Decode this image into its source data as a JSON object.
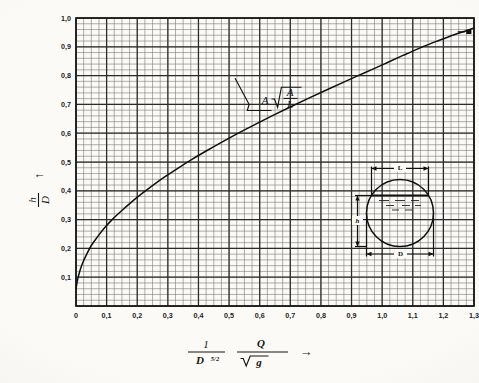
{
  "figure": {
    "background_color": "#fbfaf7",
    "ink_color": "#1a1a1a",
    "grid_minor_color": "#6f6f6f",
    "grid_major_color": "#2b2b2b"
  },
  "axes": {
    "y_title_numerator": "h",
    "y_title_denominator": "D",
    "y_title_arrow": "↑",
    "x_title_part1_numerator": "1",
    "x_title_part1_denominator": "D",
    "x_title_part1_exponent": "5/2",
    "x_title_part2_numerator": "Q",
    "x_title_part2_denominator_radicand": "g",
    "x_title_arrow": "→",
    "y_tick_labels": [
      "0,1",
      "0,2",
      "0,3",
      "0,4",
      "0,5",
      "0,6",
      "0,7",
      "0,8",
      "0,9",
      "1,0"
    ],
    "y_tick_values": [
      0.1,
      0.2,
      0.3,
      0.4,
      0.5,
      0.6,
      0.7,
      0.8,
      0.9,
      1.0
    ],
    "x_tick_labels": [
      "0",
      "0,1",
      "0,2",
      "0,3",
      "0,4",
      "0,5",
      "0,6",
      "0,7",
      "0,8",
      "0,9",
      "1,0",
      "1,1",
      "1,2",
      "1,3"
    ],
    "x_tick_values": [
      0,
      0.1,
      0.2,
      0.3,
      0.4,
      0.5,
      0.6,
      0.7,
      0.8,
      0.9,
      1.0,
      1.1,
      1.2,
      1.3
    ]
  },
  "annotation": {
    "label_lead": "A",
    "label_radical_numerator": "A",
    "label_radical_denominator": "L",
    "points_to_x": 0.52,
    "points_to_y": 0.79
  },
  "inset": {
    "caption_top": "L",
    "caption_left": "h",
    "caption_bottom": "D",
    "description": "partially filled circular pipe cross-section"
  },
  "chart_data": {
    "type": "line",
    "title": "",
    "xlabel": "1/D^(5/2) · Q/√g",
    "ylabel": "h/D",
    "xlim": [
      0,
      1.3
    ],
    "ylim": [
      0,
      1.0
    ],
    "grid": true,
    "grid_major_step_x": 0.1,
    "grid_major_step_y": 0.1,
    "grid_minor_step_x": 0.025,
    "grid_minor_step_y": 0.02,
    "legend": null,
    "series": [
      {
        "name": "h/D vs discharge parameter",
        "x": [
          0.0,
          0.005,
          0.012,
          0.022,
          0.035,
          0.05,
          0.07,
          0.092,
          0.118,
          0.148,
          0.18,
          0.215,
          0.252,
          0.292,
          0.335,
          0.38,
          0.428,
          0.478,
          0.53,
          0.584,
          0.64,
          0.698,
          0.757,
          0.818,
          0.88,
          0.943,
          1.006,
          1.068,
          1.128,
          1.185,
          1.235,
          1.275,
          1.3
        ],
        "y": [
          0.06,
          0.09,
          0.12,
          0.15,
          0.18,
          0.21,
          0.24,
          0.27,
          0.3,
          0.33,
          0.36,
          0.39,
          0.42,
          0.45,
          0.48,
          0.51,
          0.54,
          0.57,
          0.6,
          0.63,
          0.66,
          0.69,
          0.72,
          0.75,
          0.78,
          0.81,
          0.84,
          0.87,
          0.898,
          0.922,
          0.942,
          0.956,
          0.965
        ]
      }
    ],
    "markers": [
      {
        "name": "end-marker",
        "x": 1.283,
        "y": 0.952
      }
    ]
  }
}
